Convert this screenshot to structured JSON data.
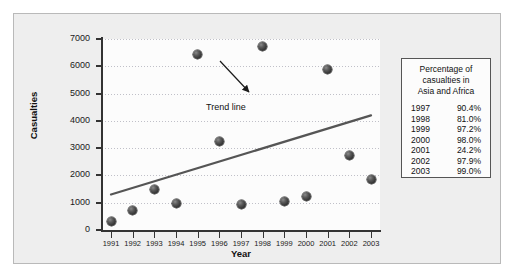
{
  "chart_data": {
    "type": "scatter",
    "title": "",
    "xlabel": "Year",
    "ylabel": "Casualties",
    "x": [
      1991,
      1992,
      1993,
      1994,
      1995,
      1996,
      1997,
      1998,
      1999,
      2000,
      2001,
      2002,
      2003
    ],
    "categories": [
      "1991",
      "1992",
      "1993",
      "1994",
      "1995",
      "1996",
      "1997",
      "1998",
      "1999",
      "2000",
      "2001",
      "2002",
      "2003"
    ],
    "values": [
      300,
      700,
      1500,
      980,
      6450,
      3250,
      930,
      6720,
      1030,
      1230,
      5900,
      2730,
      1850
    ],
    "series": [
      {
        "name": "Casualties",
        "type": "scatter",
        "values": [
          300,
          700,
          1500,
          980,
          6450,
          3250,
          930,
          6720,
          1030,
          1230,
          5900,
          2730,
          1850
        ]
      },
      {
        "name": "Trend line",
        "type": "line",
        "x": [
          1991,
          2003
        ],
        "values": [
          1300,
          4200
        ]
      }
    ],
    "ylim": [
      0,
      7000
    ],
    "xlim": [
      1991,
      2003
    ],
    "yticks": [
      0,
      1000,
      2000,
      3000,
      4000,
      5000,
      6000,
      7000
    ],
    "ytick_labels": [
      "0",
      "1000",
      "2000",
      "3000",
      "4000",
      "5000",
      "6000",
      "7000"
    ],
    "xtick_labels": [
      "1991",
      "1992",
      "1993",
      "1994",
      "1995",
      "1996",
      "1997",
      "1998",
      "1999",
      "2000",
      "2001",
      "2002",
      "2003"
    ],
    "grid": true,
    "grid_axis": "y",
    "legend_position": "right-outside",
    "annotations": [
      {
        "text": "Trend line",
        "points_to": "trend-line"
      }
    ],
    "marker_color": "#3a3a3a",
    "trend_line_color": "#555555"
  },
  "legend": {
    "title_lines": [
      "Percentage of",
      "casualties in",
      "Asia and Africa"
    ],
    "rows": [
      {
        "year": "1997",
        "percent": "90.4%"
      },
      {
        "year": "1998",
        "percent": "81.0%"
      },
      {
        "year": "1999",
        "percent": "97.2%"
      },
      {
        "year": "2000",
        "percent": "98.0%"
      },
      {
        "year": "2001",
        "percent": "24.2%"
      },
      {
        "year": "2002",
        "percent": "97.9%"
      },
      {
        "year": "2003",
        "percent": "99.0%"
      }
    ]
  },
  "colors": {
    "figure_background": "#eeeeee",
    "plot_background": "#fcfcfc",
    "axis": "#333333",
    "gridline": "#c0c0c8",
    "marker": "#3a3a3a",
    "trend_line": "#555555",
    "border": "#b9b9b9"
  }
}
